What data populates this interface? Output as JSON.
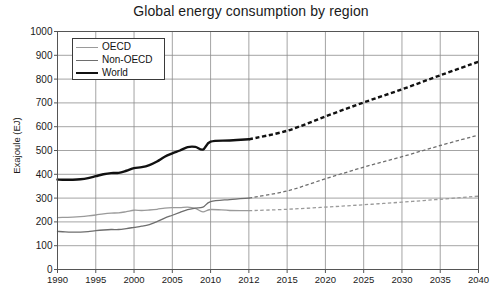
{
  "chart_data": {
    "type": "line",
    "title": "Global energy consumption by region",
    "xlabel": "",
    "ylabel": "Exajoule (EJ)",
    "xlim": [
      1990,
      2040
    ],
    "ylim": [
      0,
      1000
    ],
    "ytick_step": 100,
    "grid": true,
    "legend_position": "top-left",
    "ytick_labels": [
      "0",
      "100",
      "200",
      "300",
      "400",
      "500",
      "600",
      "700",
      "800",
      "900",
      "1000"
    ],
    "xtick_labels": [
      "1990",
      "1995",
      "2000",
      "2005",
      "2010",
      "2012",
      "2015",
      "2020",
      "2025",
      "2030",
      "2035",
      "2040"
    ],
    "xticks": [
      1990,
      1995,
      2000,
      2005,
      2010,
      2012,
      2015,
      2020,
      2025,
      2030,
      2035,
      2040
    ],
    "forecast_start_year": 2012,
    "annotations": [
      "Solid segments are historical data (1990-2012); dashed segments are projections (2012-2040)."
    ],
    "series": [
      {
        "name": "OECD",
        "color": "#9a9a9a",
        "width": 1.3,
        "x": [
          1990,
          1991,
          1992,
          1993,
          1994,
          1995,
          1996,
          1997,
          1998,
          1999,
          2000,
          2001,
          2002,
          2003,
          2004,
          2005,
          2006,
          2007,
          2008,
          2009,
          2010,
          2011,
          2012,
          2015,
          2020,
          2025,
          2030,
          2035,
          2040
        ],
        "values": [
          218,
          219,
          220,
          222,
          225,
          229,
          234,
          237,
          238,
          243,
          249,
          248,
          250,
          253,
          258,
          260,
          260,
          262,
          257,
          242,
          252,
          248,
          247,
          253,
          262,
          272,
          283,
          295,
          308
        ]
      },
      {
        "name": "Non-OECD",
        "color": "#6e6e6e",
        "width": 1.3,
        "x": [
          1990,
          1991,
          1992,
          1993,
          1994,
          1995,
          1996,
          1997,
          1998,
          1999,
          2000,
          2001,
          2002,
          2003,
          2004,
          2005,
          2006,
          2007,
          2008,
          2009,
          2010,
          2011,
          2012,
          2015,
          2020,
          2025,
          2030,
          2035,
          2040
        ],
        "values": [
          160,
          158,
          157,
          157,
          159,
          163,
          166,
          168,
          168,
          172,
          177,
          182,
          189,
          201,
          216,
          228,
          240,
          252,
          258,
          262,
          285,
          294,
          300,
          330,
          381,
          430,
          474,
          521,
          565
        ]
      },
      {
        "name": "World",
        "color": "#111111",
        "width": 2.4,
        "x": [
          1990,
          1991,
          1992,
          1993,
          1994,
          1995,
          1996,
          1997,
          1998,
          1999,
          2000,
          2001,
          2002,
          2003,
          2004,
          2005,
          2006,
          2007,
          2008,
          2009,
          2010,
          2011,
          2012,
          2015,
          2020,
          2025,
          2030,
          2035,
          2040
        ],
        "values": [
          378,
          377,
          377,
          379,
          384,
          392,
          400,
          405,
          406,
          415,
          426,
          430,
          439,
          454,
          474,
          488,
          500,
          514,
          515,
          504,
          537,
          542,
          547,
          583,
          643,
          702,
          757,
          816,
          873
        ]
      }
    ]
  },
  "legend": {
    "items": [
      {
        "label": "OECD"
      },
      {
        "label": "Non-OECD"
      },
      {
        "label": "World"
      }
    ]
  }
}
